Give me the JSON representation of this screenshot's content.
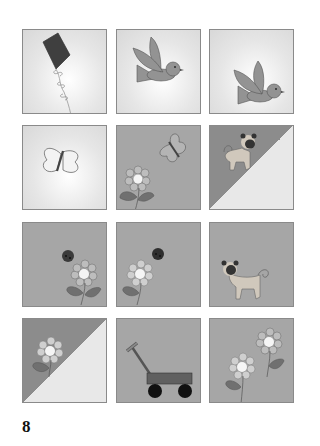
{
  "page": {
    "page_number": "8"
  },
  "grid": {
    "rows": 4,
    "cols": 3,
    "tiles": [
      {
        "row": 1,
        "col": 1,
        "background": "light",
        "motif": "kite"
      },
      {
        "row": 1,
        "col": 2,
        "background": "light",
        "motif": "bird"
      },
      {
        "row": 1,
        "col": 3,
        "background": "light",
        "motif": "bird"
      },
      {
        "row": 2,
        "col": 1,
        "background": "light",
        "motif": "butterfly"
      },
      {
        "row": 2,
        "col": 2,
        "background": "gray",
        "motif": "butterfly-and-flower"
      },
      {
        "row": 2,
        "col": 3,
        "background": "diagonal-split",
        "motif": "pug"
      },
      {
        "row": 3,
        "col": 1,
        "background": "gray",
        "motif": "ladybug-and-flower"
      },
      {
        "row": 3,
        "col": 2,
        "background": "gray",
        "motif": "ladybug-and-flower"
      },
      {
        "row": 3,
        "col": 3,
        "background": "gray",
        "motif": "pug"
      },
      {
        "row": 4,
        "col": 1,
        "background": "diagonal-split",
        "motif": "flower"
      },
      {
        "row": 4,
        "col": 2,
        "background": "gray",
        "motif": "wagon"
      },
      {
        "row": 4,
        "col": 3,
        "background": "gray",
        "motif": "two-flowers"
      }
    ]
  },
  "colors": {
    "tile_light": "#e4e4e4",
    "tile_gray": "#a6a6a6",
    "tile_dark": "#8c8c8c",
    "kite": "#3f3f3f",
    "bird": "#939393",
    "leaf": "#6f6f6f",
    "border": "#8a8a8a"
  }
}
